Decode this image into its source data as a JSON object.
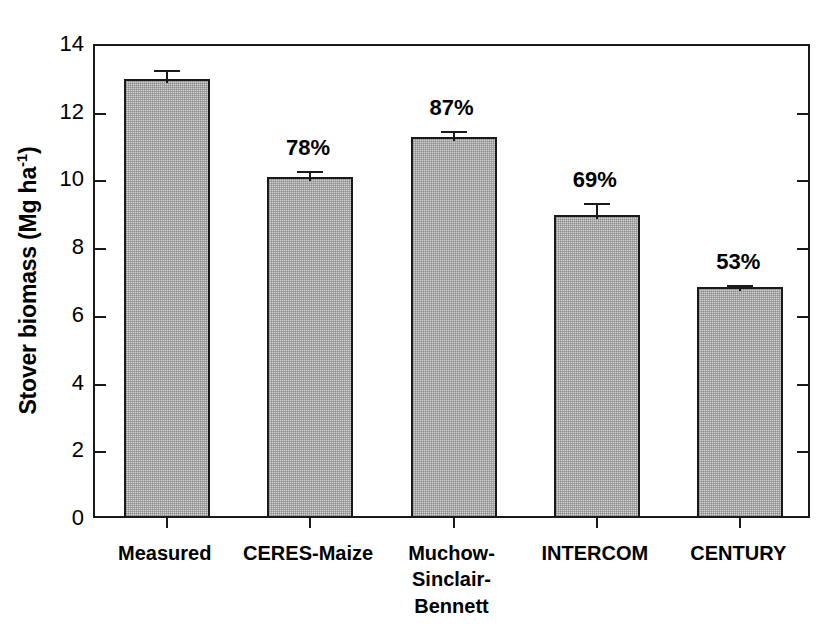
{
  "chart_data": {
    "type": "bar",
    "title": "",
    "xlabel": "",
    "ylabel": "Stover biomass (Mg ha-1)",
    "ylabel_prefix": "Stover biomass (Mg ha",
    "ylabel_sup": "-1",
    "ylabel_suffix": ")",
    "ylim": [
      0,
      14
    ],
    "ytick_step": 2,
    "yticks": [
      "0",
      "2",
      "4",
      "6",
      "8",
      "10",
      "12",
      "14"
    ],
    "grid": false,
    "legend": "none",
    "categories": [
      "Measured",
      "CERES-Maize",
      "Muchow-\nSinclair-\nBennett",
      "INTERCOM",
      "CENTURY"
    ],
    "values": [
      12.9,
      10.0,
      11.2,
      8.9,
      6.75
    ],
    "errors": [
      0.38,
      0.3,
      0.3,
      0.45,
      0.18
    ],
    "data_labels": [
      "",
      "78%",
      "87%",
      "69%",
      "53%"
    ],
    "bar_fill_color": "#cfcfcf",
    "bar_edge_color": "#1a1a1a",
    "axis_color": "#1a1a1a",
    "background_color": "#ffffff"
  }
}
